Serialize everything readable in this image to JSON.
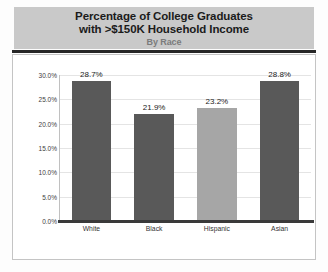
{
  "chart_data": {
    "type": "bar",
    "title": "Percentage of College Graduates with >$150K Household Income",
    "title_line1": "Percentage of College Graduates",
    "title_line2": "with >$150K Household Income",
    "subtitle": "By Race",
    "xlabel": "",
    "ylabel": "",
    "categories": [
      "White",
      "Black",
      "Hispanic",
      "Asian"
    ],
    "values": [
      28.7,
      21.9,
      23.2,
      28.8
    ],
    "value_labels": [
      "28.7%",
      "21.9%",
      "23.2%",
      "28.8%"
    ],
    "bar_colors": [
      "#595959",
      "#595959",
      "#a6a6a6",
      "#595959"
    ],
    "ylim": [
      0,
      30
    ],
    "ytick_values": [
      0,
      5,
      10,
      15,
      20,
      25,
      30
    ],
    "ytick_labels": [
      "0.0%",
      "5.0%",
      "10.0%",
      "15.0%",
      "20.0%",
      "25.0%",
      "30.0%"
    ],
    "grid": true,
    "legend": false,
    "legend_position": "none"
  },
  "style": {
    "banner_color": "#c9c9c9",
    "rule_color": "#262626",
    "panel_bg": "#ffffff",
    "gridline_color": "#e4e4e4",
    "axis_color": "#3a3a3a",
    "title_color": "#1b1b1b",
    "subtitle_color": "#7b7b7b",
    "tick_color": "#3d3d3d",
    "page_bg": "#fdfdfd"
  }
}
